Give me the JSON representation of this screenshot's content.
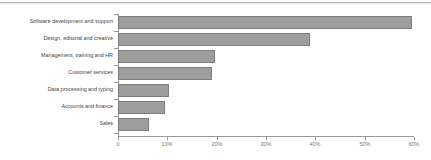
{
  "chart_data": {
    "type": "bar",
    "orientation": "horizontal",
    "title": "",
    "xlabel": "",
    "ylabel": "",
    "categories": [
      "Software development and support",
      "Design, editorial and creative",
      "Management, training and HR",
      "Customer services",
      "Data processing and typing",
      "Accounts and finance",
      "Sales"
    ],
    "values": [
      59.6,
      38.9,
      19.7,
      19.0,
      10.3,
      9.6,
      6.2
    ],
    "xlim": [
      0,
      60
    ],
    "xticks": [
      0,
      10,
      20,
      30,
      40,
      50,
      60
    ],
    "xticklabels": [
      "0",
      "10%",
      "20%",
      "30%",
      "40%",
      "50%",
      "60%"
    ],
    "grid": false,
    "legend": false,
    "bar_color": "#9d9d9d",
    "bar_edge_color": "#7d7d7d",
    "axis_color": "#9a9a9a",
    "label_color": "#3f3f3f",
    "tick_label_color": "#77797b",
    "background_color": "#ffffff"
  }
}
